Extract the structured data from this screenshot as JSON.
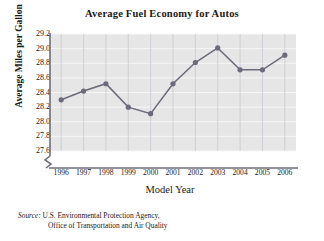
{
  "chart_data": {
    "type": "line",
    "title": "Average Fuel Economy for Autos",
    "xlabel": "Model Year",
    "ylabel": "Average Miles per Gallon",
    "categories": [
      "1996",
      "1997",
      "1998",
      "1999",
      "2000",
      "2001",
      "2002",
      "2003",
      "2004",
      "2005",
      "2006"
    ],
    "values": [
      28.3,
      28.42,
      28.52,
      28.2,
      28.11,
      28.52,
      28.81,
      29.01,
      28.71,
      28.71,
      28.91
    ],
    "ylim": [
      27.6,
      29.2
    ],
    "ytick_labels": [
      "29.2",
      "29.0",
      "28.8",
      "28.6",
      "28.4",
      "28.2",
      "28.0",
      "27.8",
      "27.6"
    ],
    "ytick_values": [
      29.2,
      29.0,
      28.8,
      28.6,
      28.4,
      28.2,
      28.0,
      27.8,
      27.6
    ],
    "y_axis_break": true,
    "grid": "both",
    "legend": "none",
    "marker": "circle",
    "series_color": "#6b6b7a",
    "plot_background": "#e6e6e6",
    "grid_color": "#f7f7f7",
    "axis_color": "#6e6e78"
  },
  "source": {
    "label": "Source:",
    "line1": "U.S. Environmental Protection Agency,",
    "line2": "Office of Transportation and Air Quality"
  }
}
